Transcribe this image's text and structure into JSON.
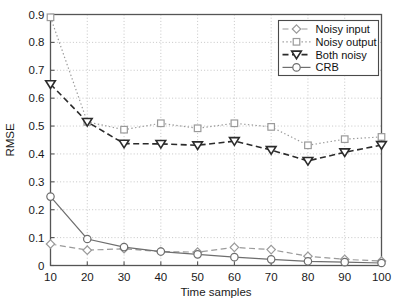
{
  "chart_data": {
    "type": "line",
    "title": "",
    "xlabel": "Time samples",
    "ylabel": "RMSE",
    "x": [
      10,
      20,
      30,
      40,
      50,
      60,
      70,
      80,
      90,
      100
    ],
    "xlim": [
      10,
      100
    ],
    "ylim": [
      0,
      0.9
    ],
    "xticks": [
      "10",
      "20",
      "30",
      "40",
      "50",
      "60",
      "70",
      "80",
      "90",
      "100"
    ],
    "yticks": [
      "0",
      "0.1",
      "0.2",
      "0.3",
      "0.4",
      "0.5",
      "0.6",
      "0.7",
      "0.8",
      "0.9"
    ],
    "grid": true,
    "legend_position": "top-right",
    "series": [
      {
        "name": "Noisy input",
        "marker": "diamond",
        "linestyle": "dashed",
        "color": "#9a9a9a",
        "values": [
          0.077,
          0.055,
          0.06,
          0.05,
          0.048,
          0.065,
          0.057,
          0.033,
          0.022,
          0.016
        ]
      },
      {
        "name": "Noisy output",
        "marker": "square",
        "linestyle": "dotted",
        "color": "#9a9a9a",
        "values": [
          0.89,
          0.515,
          0.487,
          0.51,
          0.492,
          0.51,
          0.497,
          0.431,
          0.453,
          0.461
        ]
      },
      {
        "name": "Both noisy",
        "marker": "triangle-down",
        "linestyle": "dashed",
        "color": "#2b2b2b",
        "values": [
          0.65,
          0.515,
          0.437,
          0.436,
          0.431,
          0.446,
          0.414,
          0.375,
          0.406,
          0.432
        ]
      },
      {
        "name": "CRB",
        "marker": "circle",
        "linestyle": "solid",
        "color": "#6e6e6e",
        "values": [
          0.247,
          0.095,
          0.066,
          0.05,
          0.04,
          0.03,
          0.022,
          0.015,
          0.012,
          0.009
        ]
      }
    ]
  },
  "legend": {
    "items": [
      {
        "label": "Noisy input"
      },
      {
        "label": "Noisy output"
      },
      {
        "label": "Both noisy"
      },
      {
        "label": "CRB"
      }
    ]
  },
  "axes": {
    "x_title": "Time samples",
    "y_title": "RMSE"
  },
  "colors": {
    "axis": "#555555",
    "grid": "#b8b8b8",
    "background": "#ffffff",
    "text": "#111111"
  }
}
